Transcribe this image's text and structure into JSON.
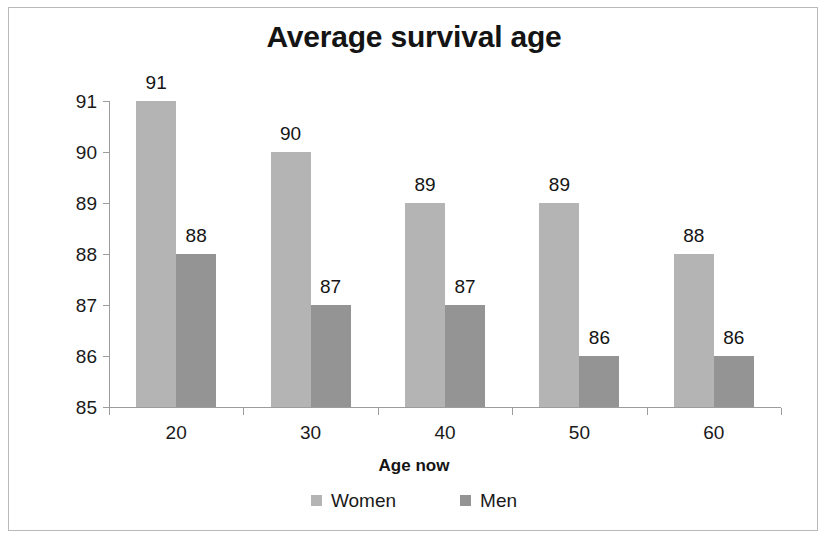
{
  "chart_data": {
    "type": "bar",
    "title": "Average survival age",
    "xlabel": "Age now",
    "ylabel": "",
    "categories": [
      "20",
      "30",
      "40",
      "50",
      "60"
    ],
    "series": [
      {
        "name": "Women",
        "values": [
          91,
          90,
          89,
          89,
          88
        ],
        "color": "#b4b4b4"
      },
      {
        "name": "Men",
        "values": [
          88,
          87,
          87,
          86,
          86
        ],
        "color": "#949494"
      }
    ],
    "ylim": [
      85,
      91
    ],
    "y_ticks": [
      85,
      86,
      87,
      88,
      89,
      90,
      91
    ],
    "y_tick_labels": [
      "85",
      "86",
      "87",
      "88",
      "89",
      "90",
      "91"
    ],
    "grid": false,
    "legend_position": "bottom",
    "data_labels": true,
    "border_color": "#b9b9b9",
    "axis_color": "#9c9c9c",
    "text_color": "#141414"
  },
  "legend": {
    "items": [
      {
        "label": "Women",
        "color": "#b4b4b4"
      },
      {
        "label": "Men",
        "color": "#949494"
      }
    ]
  }
}
